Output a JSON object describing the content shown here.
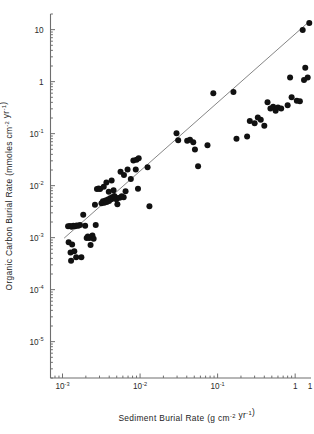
{
  "chart_data": {
    "type": "scatter",
    "title": "",
    "xlabel": "Sediment Burial Rate (g cm-2 yr-1)",
    "ylabel": "Organic Carbon Burial Rate (mmoles cm-2 yr-1)",
    "xscale": "log",
    "yscale": "log",
    "xlim": [
      0.0007,
      1.6
    ],
    "ylim": [
      2e-06,
      20
    ],
    "grid": false,
    "legend": "none",
    "xticks": [
      {
        "value": 0.001,
        "label": "10",
        "exp": "-3"
      },
      {
        "value": 0.01,
        "label": "10",
        "exp": "-2"
      },
      {
        "value": 0.1,
        "label": "10",
        "exp": "-1"
      },
      {
        "value": 1,
        "label": "1",
        "exp": ""
      }
    ],
    "yticks": [
      {
        "value": 10,
        "label": "10",
        "exp": ""
      },
      {
        "value": 1,
        "label": "1",
        "exp": ""
      },
      {
        "value": 0.1,
        "label": "10",
        "exp": "-1"
      },
      {
        "value": 0.01,
        "label": "10",
        "exp": "-2"
      },
      {
        "value": 0.001,
        "label": "10",
        "exp": "-3"
      },
      {
        "value": 0.0001,
        "label": "10",
        "exp": "-4"
      },
      {
        "value": 1e-05,
        "label": "10",
        "exp": "-5"
      }
    ],
    "fit_line": {
      "x": [
        0.00105,
        1.45
      ],
      "y": [
        0.00098,
        13.5
      ]
    },
    "marker": {
      "shape": "circle",
      "color": "#111111",
      "radius": 3.0
    },
    "points": [
      [
        0.00118,
        0.00165
      ],
      [
        0.00125,
        0.00168
      ],
      [
        0.00131,
        0.00162
      ],
      [
        0.00138,
        0.0017
      ],
      [
        0.00145,
        0.00166
      ],
      [
        0.00152,
        0.00172
      ],
      [
        0.0016,
        0.00169
      ],
      [
        0.00168,
        0.00175
      ],
      [
        0.0012,
        0.00082
      ],
      [
        0.00127,
        0.00052
      ],
      [
        0.00133,
        0.00074
      ],
      [
        0.00129,
        0.00036
      ],
      [
        0.00142,
        0.00055
      ],
      [
        0.0015,
        0.00042
      ],
      [
        0.00175,
        0.00042
      ],
      [
        0.00196,
        0.0017
      ],
      [
        0.00205,
        0.00098
      ],
      [
        0.00212,
        0.00105
      ],
      [
        0.00222,
        0.00098
      ],
      [
        0.00185,
        0.00275
      ],
      [
        0.0023,
        0.00072
      ],
      [
        0.00243,
        0.0011
      ],
      [
        0.00252,
        0.00095
      ],
      [
        0.00268,
        0.00175
      ],
      [
        0.00262,
        0.0043
      ],
      [
        0.00278,
        0.0086
      ],
      [
        0.00292,
        0.0088
      ],
      [
        0.00305,
        0.0086
      ],
      [
        0.00318,
        0.0046
      ],
      [
        0.00332,
        0.005
      ],
      [
        0.00345,
        0.0047
      ],
      [
        0.00358,
        0.0052
      ],
      [
        0.00372,
        0.00485
      ],
      [
        0.00385,
        0.0054
      ],
      [
        0.00398,
        0.00505
      ],
      [
        0.00412,
        0.00575
      ],
      [
        0.00425,
        0.00545
      ],
      [
        0.00438,
        0.006
      ],
      [
        0.00452,
        0.0057
      ],
      [
        0.00465,
        0.0063
      ],
      [
        0.0034,
        0.0095
      ],
      [
        0.00368,
        0.0115
      ],
      [
        0.00395,
        0.0076
      ],
      [
        0.0043,
        0.0125
      ],
      [
        0.00455,
        0.0082
      ],
      [
        0.0048,
        0.006
      ],
      [
        0.00495,
        0.00545
      ],
      [
        0.0051,
        0.0044
      ],
      [
        0.00545,
        0.00585
      ],
      [
        0.0058,
        0.00625
      ],
      [
        0.00615,
        0.006
      ],
      [
        0.0065,
        0.0078
      ],
      [
        0.0056,
        0.0185
      ],
      [
        0.0062,
        0.016
      ],
      [
        0.0069,
        0.0205
      ],
      [
        0.0076,
        0.0135
      ],
      [
        0.0082,
        0.0305
      ],
      [
        0.009,
        0.0315
      ],
      [
        0.0096,
        0.0335
      ],
      [
        0.0088,
        0.0205
      ],
      [
        0.0094,
        0.0087
      ],
      [
        0.0125,
        0.0225
      ],
      [
        0.0132,
        0.004
      ],
      [
        0.0295,
        0.102
      ],
      [
        0.031,
        0.075
      ],
      [
        0.0405,
        0.073
      ],
      [
        0.044,
        0.0765
      ],
      [
        0.0485,
        0.0685
      ],
      [
        0.051,
        0.0495
      ],
      [
        0.056,
        0.0235
      ],
      [
        0.074,
        0.06
      ],
      [
        0.088,
        0.6
      ],
      [
        0.16,
        0.63
      ],
      [
        0.175,
        0.08
      ],
      [
        0.24,
        0.088
      ],
      [
        0.26,
        0.175
      ],
      [
        0.3,
        0.158
      ],
      [
        0.33,
        0.205
      ],
      [
        0.36,
        0.185
      ],
      [
        0.4,
        0.142
      ],
      [
        0.44,
        0.4
      ],
      [
        0.48,
        0.305
      ],
      [
        0.52,
        0.33
      ],
      [
        0.56,
        0.275
      ],
      [
        0.6,
        0.32
      ],
      [
        0.66,
        0.305
      ],
      [
        0.8,
        0.35
      ],
      [
        0.86,
        1.2
      ],
      [
        0.9,
        0.5
      ],
      [
        1.05,
        0.43
      ],
      [
        1.15,
        0.42
      ],
      [
        1.3,
        1.08
      ],
      [
        1.35,
        1.85
      ],
      [
        1.45,
        1.2
      ],
      [
        1.25,
        9.8
      ],
      [
        1.52,
        13.5
      ]
    ]
  }
}
